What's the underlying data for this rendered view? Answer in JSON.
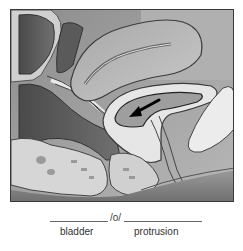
{
  "figure": {
    "arrow_icon": "arrow-pointing-left-down"
  },
  "term_builder": {
    "combining_vowel": "/o/",
    "parts": [
      {
        "label": "bladder"
      },
      {
        "label": "protrusion"
      }
    ]
  },
  "colors": {
    "frame_border": "#3a3a3a",
    "text": "#333333",
    "rule": "#666666"
  }
}
